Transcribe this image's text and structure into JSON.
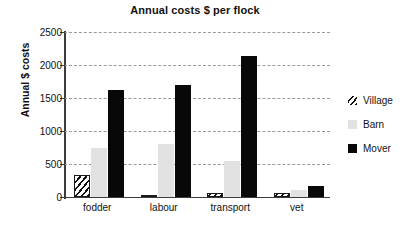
{
  "chart_data": {
    "type": "bar",
    "title": "Annual costs $ per flock",
    "xlabel": "",
    "ylabel": "Annual $ costs",
    "ylim": [
      0,
      2500
    ],
    "yticks": [
      0,
      500,
      1000,
      1500,
      2000,
      2500
    ],
    "ytick_labels": [
      "0",
      "500",
      "1000",
      "1500",
      "2000",
      "2500"
    ],
    "grid": "horizontal-dashed",
    "legend_position": "right",
    "categories": [
      "fodder",
      "labour",
      "transport",
      "vet"
    ],
    "series": [
      {
        "name": "Village",
        "pattern": "diagonal-hatch",
        "color": "#111111",
        "values": [
          330,
          20,
          60,
          50
        ]
      },
      {
        "name": "Barn",
        "pattern": "solid",
        "color": "#e2e2e2",
        "values": [
          740,
          800,
          545,
          100
        ]
      },
      {
        "name": "Mover",
        "pattern": "solid",
        "color": "#080808",
        "values": [
          1620,
          1690,
          2130,
          160
        ]
      }
    ]
  },
  "legend": {
    "items": [
      {
        "label": "Village"
      },
      {
        "label": "Barn"
      },
      {
        "label": "Mover"
      }
    ]
  },
  "colors": {
    "axis": "#3c3c3c",
    "gridline": "#9a9a9a",
    "text": "#111111",
    "background": "#ffffff"
  }
}
